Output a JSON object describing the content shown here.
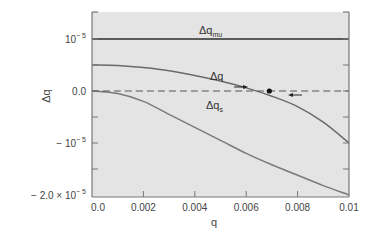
{
  "chart_data": {
    "type": "line",
    "title": "",
    "xlabel": "q",
    "ylabel": "Δq",
    "xlim": [
      0.0,
      0.01
    ],
    "ylim": [
      -2e-05,
      1.5e-05
    ],
    "grid": false,
    "legend": "inline labels on curves",
    "x_ticks": [
      0.0,
      0.002,
      0.004,
      0.006,
      0.008,
      0.01
    ],
    "x_tick_labels": [
      "0.0",
      "0.002",
      "0.004",
      "0.006",
      "0.008",
      "0.01"
    ],
    "y_ticks": [
      1e-05,
      5e-06,
      0.0,
      -5e-06,
      -1e-05,
      -1.5e-05,
      -2e-05
    ],
    "y_tick_labels": [
      {
        "value": 1e-05,
        "base": "10",
        "exp": "− 5",
        "prefix": ""
      },
      {
        "value": 0.0,
        "text": "0.0"
      },
      {
        "value": -1e-05,
        "base": "10",
        "exp": "− 5",
        "prefix": "− "
      },
      {
        "value": -2e-05,
        "base": "10",
        "exp": "− 5",
        "prefix": "− 2.0 × "
      }
    ],
    "series": [
      {
        "name": "Δq_mu",
        "label_main": "Δq",
        "label_sub": "mu",
        "x": [
          0.0,
          0.002,
          0.004,
          0.006,
          0.008,
          0.01
        ],
        "y": [
          1e-05,
          1e-05,
          1e-05,
          1e-05,
          1e-05,
          1e-05
        ],
        "style": "solid",
        "color": "#5a5a5a"
      },
      {
        "name": "Δq",
        "label_main": "Δq",
        "label_sub": "",
        "x": [
          0.0,
          0.001,
          0.002,
          0.003,
          0.004,
          0.005,
          0.006,
          0.007,
          0.008,
          0.009,
          0.01
        ],
        "y": [
          5e-06,
          4.9e-06,
          4.5e-06,
          3.9e-06,
          3e-06,
          1.9e-06,
          6e-07,
          -1e-06,
          -3e-06,
          -6e-06,
          -1e-05
        ],
        "style": "solid",
        "color": "#6a6a6a"
      },
      {
        "name": "Δq_s",
        "label_main": "Δq",
        "label_sub": "s",
        "x": [
          0.0,
          0.001,
          0.002,
          0.003,
          0.004,
          0.005,
          0.006,
          0.007,
          0.008,
          0.009,
          0.01
        ],
        "y": [
          0.0,
          -5e-07,
          -2e-06,
          -4.5e-06,
          -7e-06,
          -9.5e-06,
          -1.2e-05,
          -1.42e-05,
          -1.62e-05,
          -1.82e-05,
          -2e-05
        ],
        "style": "solid",
        "color": "#7a7a7a"
      },
      {
        "name": "zero line",
        "x": [
          0.0,
          0.01
        ],
        "y": [
          0.0,
          0.0
        ],
        "style": "dashed",
        "color": "#555555"
      }
    ],
    "annotations": [
      {
        "type": "point",
        "x": 0.0069,
        "y": 0.0,
        "desc": "equilibrium (Δq crosses zero)"
      },
      {
        "type": "arrow",
        "x": 0.0058,
        "y": 0.0,
        "direction": "right"
      },
      {
        "type": "arrow",
        "x": 0.0079,
        "y": 0.0,
        "direction": "left"
      }
    ]
  },
  "colors": {
    "plot_bg": "#e4e4e4",
    "frame": "#777777",
    "curve": "#6e6e6e",
    "mu_line": "#555555"
  }
}
